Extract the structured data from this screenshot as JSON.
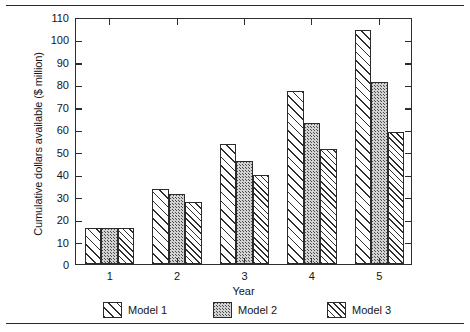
{
  "chart_data": {
    "type": "bar",
    "title": "",
    "subtitle": "",
    "xlabel": "Year",
    "ylabel": "Cumulative dollars available ($ million)",
    "categories": [
      "1",
      "2",
      "3",
      "4",
      "5"
    ],
    "series": [
      {
        "name": "Model 1",
        "pattern": "diagonal-hatch-sparse",
        "values": [
          16,
          33.5,
          53.5,
          77,
          104
        ]
      },
      {
        "name": "Model 2",
        "pattern": "gray-stipple",
        "values": [
          16,
          31,
          46,
          63,
          81
        ]
      },
      {
        "name": "Model 3",
        "pattern": "diagonal-hatch-dense",
        "values": [
          16,
          27.5,
          39.5,
          51,
          59
        ]
      }
    ],
    "ylim": [
      0,
      110
    ],
    "ytick_step": 10,
    "yticks": [
      "0",
      "10",
      "20",
      "30",
      "40",
      "50",
      "60",
      "70",
      "80",
      "90",
      "100",
      "110"
    ],
    "xticks": [
      "1",
      "2",
      "3",
      "4",
      "5"
    ],
    "grid": false,
    "legend_position": "bottom",
    "frame": "box-with-mirrored-ticks"
  },
  "legend": {
    "items": [
      {
        "label": "Model 1"
      },
      {
        "label": "Model 2"
      },
      {
        "label": "Model 3"
      }
    ]
  }
}
